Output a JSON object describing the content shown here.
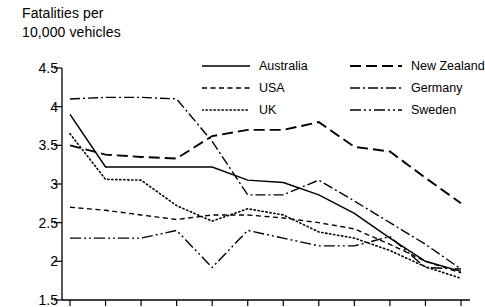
{
  "chart_data": {
    "type": "line",
    "title": "Fatalities per\n10,000 vehicles",
    "xlabel": "",
    "ylabel": "",
    "ylim": [
      1.5,
      4.5
    ],
    "ytick_labels": [
      "4.5",
      "4",
      "3.5",
      "3",
      "2.5",
      "2",
      "1.5"
    ],
    "ytick_values": [
      4.5,
      4,
      3.5,
      3,
      2.5,
      2,
      1.5
    ],
    "grid": false,
    "legend_position": "top-inside",
    "x": [
      1,
      2,
      3,
      4,
      5,
      6,
      7,
      8,
      9,
      10,
      11,
      12
    ],
    "xtick_count": 12,
    "xtick_labels": [],
    "series": [
      {
        "name": "Australia",
        "style": "solid",
        "color": "#000000",
        "values": [
          3.9,
          3.22,
          3.22,
          3.22,
          3.22,
          3.05,
          3.02,
          2.86,
          2.62,
          2.3,
          2.0,
          1.87
        ]
      },
      {
        "name": "USA",
        "style": "dashed",
        "color": "#000000",
        "values": [
          2.7,
          2.66,
          2.6,
          2.54,
          2.6,
          2.6,
          2.56,
          2.5,
          2.42,
          2.22,
          2.0,
          1.85
        ]
      },
      {
        "name": "UK",
        "style": "dotted",
        "color": "#000000",
        "values": [
          3.65,
          3.06,
          3.05,
          2.72,
          2.52,
          2.68,
          2.6,
          2.38,
          2.3,
          2.14,
          1.93,
          1.78
        ]
      },
      {
        "name": "New Zealand",
        "style": "longdash",
        "color": "#000000",
        "values": [
          3.5,
          3.38,
          3.35,
          3.33,
          3.62,
          3.7,
          3.7,
          3.8,
          3.48,
          3.42,
          3.08,
          2.75
        ]
      },
      {
        "name": "Germany",
        "style": "dashdot",
        "color": "#000000",
        "values": [
          4.1,
          4.12,
          4.12,
          4.1,
          3.55,
          2.86,
          2.86,
          3.05,
          2.78,
          2.5,
          2.22,
          1.9
        ]
      },
      {
        "name": "Sweden",
        "style": "dashdotdot",
        "color": "#000000",
        "values": [
          2.3,
          2.3,
          2.3,
          2.4,
          1.92,
          2.4,
          2.3,
          2.2,
          2.2,
          2.32,
          1.92,
          1.9
        ]
      }
    ]
  },
  "legend": {
    "column1": [
      "Australia",
      "USA",
      "UK"
    ],
    "column2": [
      "New Zealand",
      "Germany",
      "Sweden"
    ]
  }
}
